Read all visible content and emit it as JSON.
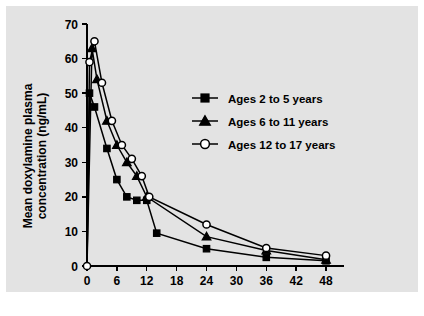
{
  "chart_data": {
    "type": "line",
    "title": "",
    "xlabel": "Nominal time post dose (h)",
    "ylabel": "Mean doxylamine plasma concentration (ng/mL)",
    "ylabel_line1": "Mean doxylamine plasma",
    "ylabel_line2": "concentration (ng/mL)",
    "xlim": [
      0,
      50
    ],
    "ylim": [
      0,
      70
    ],
    "xticks": [
      0,
      6,
      12,
      18,
      24,
      30,
      36,
      42,
      48
    ],
    "yticks": [
      0,
      10,
      20,
      30,
      40,
      50,
      60,
      70
    ],
    "grid": false,
    "legend_position": "right",
    "series": [
      {
        "name": "Ages 2 to 5 years",
        "marker": "filled-square",
        "points": [
          {
            "x": 0,
            "y": 0
          },
          {
            "x": 0.5,
            "y": 50
          },
          {
            "x": 1.5,
            "y": 46
          },
          {
            "x": 4,
            "y": 34
          },
          {
            "x": 6,
            "y": 25
          },
          {
            "x": 8,
            "y": 20
          },
          {
            "x": 10,
            "y": 19
          },
          {
            "x": 12,
            "y": 19
          },
          {
            "x": 14,
            "y": 9.5
          },
          {
            "x": 24,
            "y": 5
          },
          {
            "x": 36,
            "y": 2.5
          },
          {
            "x": 48,
            "y": 1.5
          }
        ]
      },
      {
        "name": "Ages 6 to 11 years",
        "marker": "filled-triangle",
        "points": [
          {
            "x": 0,
            "y": 0
          },
          {
            "x": 1,
            "y": 63
          },
          {
            "x": 2,
            "y": 54
          },
          {
            "x": 4,
            "y": 42
          },
          {
            "x": 6,
            "y": 35
          },
          {
            "x": 8,
            "y": 30
          },
          {
            "x": 10,
            "y": 26
          },
          {
            "x": 12,
            "y": 20
          },
          {
            "x": 24,
            "y": 8.5
          },
          {
            "x": 36,
            "y": 4.5
          },
          {
            "x": 48,
            "y": 1.8
          }
        ]
      },
      {
        "name": "Ages 12 to 17 years",
        "marker": "open-circle",
        "points": [
          {
            "x": 0,
            "y": 0
          },
          {
            "x": 0.5,
            "y": 59
          },
          {
            "x": 1.5,
            "y": 65
          },
          {
            "x": 3,
            "y": 53
          },
          {
            "x": 5,
            "y": 42
          },
          {
            "x": 7,
            "y": 35
          },
          {
            "x": 9,
            "y": 31
          },
          {
            "x": 11,
            "y": 26
          },
          {
            "x": 12.5,
            "y": 20
          },
          {
            "x": 24,
            "y": 12
          },
          {
            "x": 36,
            "y": 5.2
          },
          {
            "x": 48,
            "y": 3
          }
        ]
      }
    ]
  },
  "legend": {
    "entries": [
      {
        "label": "Ages 2 to 5 years",
        "marker": "filled-square"
      },
      {
        "label": "Ages 6 to 11 years",
        "marker": "filled-triangle"
      },
      {
        "label": "Ages 12 to 17 years",
        "marker": "open-circle"
      }
    ]
  },
  "colors": {
    "panel_background": "#e3e3e3",
    "page_background": "#ffffff",
    "ink": "#000000",
    "marker_open_fill": "#ffffff"
  }
}
